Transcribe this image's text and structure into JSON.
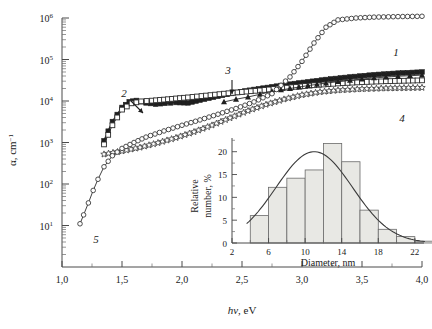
{
  "chart_data": {
    "type": "line",
    "title": "",
    "xlabel": "hν, eV",
    "ylabel": "α, cm⁻¹",
    "xlim": [
      1.0,
      4.0
    ],
    "ylim_log": [
      1,
      1000000
    ],
    "x_ticks": [
      "1,0",
      "1,5",
      "2,0",
      "2,5",
      "3,0",
      "3,5",
      "4,0"
    ],
    "y_ticks": [
      "10¹",
      "10²",
      "10³",
      "10⁴",
      "10⁵",
      "10⁶"
    ],
    "y_scale": "log",
    "grid": false,
    "legend": "curve-number-annotations",
    "series": [
      {
        "name": "1",
        "label": "1",
        "marker": "filled-square",
        "points": [
          [
            1.35,
            1100
          ],
          [
            1.42,
            3200
          ],
          [
            1.5,
            7000
          ],
          [
            1.56,
            9600
          ],
          [
            1.62,
            10300
          ],
          [
            1.7,
            9000
          ],
          [
            1.78,
            8400
          ],
          [
            1.86,
            8800
          ],
          [
            1.95,
            9200
          ],
          [
            2.05,
            9000
          ],
          [
            2.15,
            10500
          ],
          [
            2.3,
            13000
          ],
          [
            2.45,
            16000
          ],
          [
            2.6,
            19000
          ],
          [
            2.75,
            22000
          ],
          [
            2.9,
            25500
          ],
          [
            3.05,
            29000
          ],
          [
            3.2,
            33000
          ],
          [
            3.4,
            38000
          ],
          [
            3.6,
            43000
          ],
          [
            3.8,
            47000
          ],
          [
            4.0,
            50000
          ]
        ]
      },
      {
        "name": "2",
        "label": "2",
        "marker": "open-square",
        "points": [
          [
            1.35,
            900
          ],
          [
            1.42,
            2600
          ],
          [
            1.5,
            6200
          ],
          [
            1.58,
            8800
          ],
          [
            1.66,
            9800
          ],
          [
            1.75,
            10200
          ],
          [
            1.85,
            10800
          ],
          [
            1.95,
            11500
          ],
          [
            2.05,
            12200
          ],
          [
            2.2,
            13500
          ],
          [
            2.35,
            15000
          ],
          [
            2.5,
            16500
          ],
          [
            2.65,
            18000
          ],
          [
            2.8,
            20000
          ],
          [
            2.95,
            22000
          ],
          [
            3.1,
            24000
          ],
          [
            3.3,
            26500
          ],
          [
            3.5,
            28500
          ],
          [
            3.7,
            30000
          ],
          [
            4.0,
            31500
          ]
        ]
      },
      {
        "name": "3",
        "label": "3",
        "marker": "filled-triangle",
        "points": [
          [
            2.35,
            9500
          ],
          [
            2.45,
            11000
          ],
          [
            2.55,
            12500
          ],
          [
            2.65,
            14500
          ],
          [
            2.75,
            17000
          ],
          [
            2.9,
            20000
          ],
          [
            3.05,
            23500
          ],
          [
            3.2,
            27000
          ],
          [
            3.4,
            31500
          ],
          [
            3.6,
            36000
          ],
          [
            3.8,
            39500
          ],
          [
            4.0,
            42000
          ]
        ]
      },
      {
        "name": "4",
        "label": "4",
        "marker": "open-star",
        "points": [
          [
            1.35,
            520
          ],
          [
            1.5,
            620
          ],
          [
            1.65,
            760
          ],
          [
            1.8,
            980
          ],
          [
            1.95,
            1300
          ],
          [
            2.1,
            1800
          ],
          [
            2.25,
            2600
          ],
          [
            2.4,
            3900
          ],
          [
            2.55,
            5800
          ],
          [
            2.7,
            8200
          ],
          [
            2.85,
            11000
          ],
          [
            3.0,
            14000
          ],
          [
            3.15,
            16500
          ],
          [
            3.3,
            18200
          ],
          [
            3.5,
            19500
          ],
          [
            3.7,
            20300
          ],
          [
            4.0,
            21000
          ]
        ]
      },
      {
        "name": "5",
        "label": "5",
        "marker": "open-circle",
        "points": [
          [
            1.15,
            11
          ],
          [
            1.18,
            18
          ],
          [
            1.22,
            35
          ],
          [
            1.26,
            70
          ],
          [
            1.3,
            130
          ],
          [
            1.35,
            260
          ],
          [
            1.42,
            480
          ],
          [
            1.5,
            720
          ],
          [
            1.6,
            1000
          ],
          [
            1.7,
            1350
          ],
          [
            1.85,
            1900
          ],
          [
            2.0,
            2600
          ],
          [
            2.15,
            3500
          ],
          [
            2.3,
            4800
          ],
          [
            2.45,
            6600
          ],
          [
            2.6,
            9500
          ],
          [
            2.75,
            15000
          ],
          [
            2.9,
            38000
          ],
          [
            3.0,
            90000
          ],
          [
            3.1,
            250000
          ],
          [
            3.2,
            600000
          ],
          [
            3.3,
            900000
          ],
          [
            3.45,
            1000000
          ],
          [
            3.6,
            1050000
          ],
          [
            3.8,
            1080000
          ],
          [
            4.0,
            1100000
          ]
        ]
      }
    ]
  },
  "inset": {
    "type": "bar",
    "xlabel": "Diameter, nm",
    "ylabel_line1": "Relative",
    "ylabel_line2": "number, %",
    "x_ticks": [
      "2",
      "6",
      "10",
      "14",
      "18",
      "22"
    ],
    "y_ticks": [
      "0",
      "5",
      "10",
      "15",
      "20"
    ],
    "ylim": [
      0,
      23
    ],
    "xlim": [
      2,
      23
    ],
    "bin_width": 2,
    "bin_starts": [
      4,
      6,
      8,
      10,
      12,
      14,
      16,
      18,
      20,
      22
    ],
    "values": [
      6.0,
      12.2,
      14.2,
      16.0,
      21.8,
      17.8,
      7.2,
      3.0,
      1.4,
      0.4
    ],
    "fit_curve": {
      "type": "gaussian",
      "peak_value": 20.0,
      "peak_diameter": 11.0,
      "sigma": 4.2
    }
  },
  "colors": {
    "ink": "#1a1a1a",
    "bar_fill": "#e8e8e4",
    "bar_stroke": "#6a6a6a",
    "axis": "#4a4a4a"
  }
}
